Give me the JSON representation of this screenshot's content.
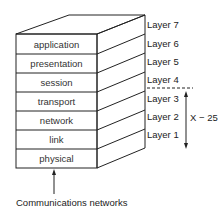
{
  "diagram": {
    "layers": [
      {
        "number_label": "Layer 7",
        "name": ""
      },
      {
        "number_label": "Layer 6",
        "name": "application"
      },
      {
        "number_label": "Layer 5",
        "name": "presentation"
      },
      {
        "number_label": "Layer 4",
        "name": "session"
      },
      {
        "number_label": "Layer 3",
        "name": "transport"
      },
      {
        "number_label": "Layer 2",
        "name": "network"
      },
      {
        "number_label": "Layer 1",
        "name": "link"
      },
      {
        "number_label": "",
        "name": "physical"
      }
    ],
    "bracket_label": "X − 25",
    "bottom_label": "Communications networks",
    "colors": {
      "line": "#222222",
      "text": "#222222",
      "background": "#ffffff"
    }
  }
}
